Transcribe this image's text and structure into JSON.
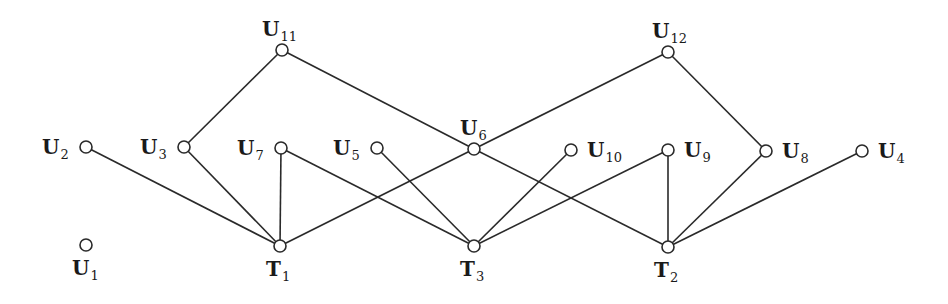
{
  "diagram": {
    "type": "bipartite-graph",
    "node_radius": 6,
    "nodes": [
      {
        "id": "U11",
        "letter": "U",
        "sub": "11",
        "x": 282,
        "y": 50,
        "label_dx": -20,
        "label_dy": -14
      },
      {
        "id": "U12",
        "letter": "U",
        "sub": "12",
        "x": 668,
        "y": 52,
        "label_dx": -16,
        "label_dy": -14
      },
      {
        "id": "U2",
        "letter": "U",
        "sub": "2",
        "x": 86,
        "y": 147,
        "label_dx": -44,
        "label_dy": 7
      },
      {
        "id": "U3",
        "letter": "U",
        "sub": "3",
        "x": 184,
        "y": 147,
        "label_dx": -44,
        "label_dy": 7
      },
      {
        "id": "U7",
        "letter": "U",
        "sub": "7",
        "x": 281,
        "y": 148,
        "label_dx": -44,
        "label_dy": 7
      },
      {
        "id": "U5",
        "letter": "U",
        "sub": "5",
        "x": 377,
        "y": 148,
        "label_dx": -44,
        "label_dy": 7
      },
      {
        "id": "U6",
        "letter": "U",
        "sub": "6",
        "x": 474,
        "y": 149,
        "label_dx": -14,
        "label_dy": -14
      },
      {
        "id": "U10",
        "letter": "U",
        "sub": "10",
        "x": 571,
        "y": 150,
        "label_dx": 16,
        "label_dy": 7
      },
      {
        "id": "U9",
        "letter": "U",
        "sub": "9",
        "x": 668,
        "y": 150,
        "label_dx": 16,
        "label_dy": 7
      },
      {
        "id": "U8",
        "letter": "U",
        "sub": "8",
        "x": 766,
        "y": 151,
        "label_dx": 16,
        "label_dy": 7
      },
      {
        "id": "U4",
        "letter": "U",
        "sub": "4",
        "x": 862,
        "y": 151,
        "label_dx": 16,
        "label_dy": 7
      },
      {
        "id": "U1",
        "letter": "U",
        "sub": "1",
        "x": 86,
        "y": 245,
        "label_dx": -14,
        "label_dy": 30
      },
      {
        "id": "T1",
        "letter": "T",
        "sub": "1",
        "x": 280,
        "y": 246,
        "label_dx": -14,
        "label_dy": 30
      },
      {
        "id": "T3",
        "letter": "T",
        "sub": "3",
        "x": 474,
        "y": 246,
        "label_dx": -14,
        "label_dy": 30
      },
      {
        "id": "T2",
        "letter": "T",
        "sub": "2",
        "x": 668,
        "y": 247,
        "label_dx": -14,
        "label_dy": 30
      }
    ],
    "edges": [
      [
        "U2",
        "T1"
      ],
      [
        "U3",
        "T1"
      ],
      [
        "U3",
        "U11"
      ],
      [
        "U11",
        "U6"
      ],
      [
        "U7",
        "T1"
      ],
      [
        "U7",
        "T3"
      ],
      [
        "U5",
        "T3"
      ],
      [
        "T1",
        "U6"
      ],
      [
        "U6",
        "U12"
      ],
      [
        "U6",
        "T2"
      ],
      [
        "U10",
        "T3"
      ],
      [
        "U9",
        "T3"
      ],
      [
        "U9",
        "T2"
      ],
      [
        "U12",
        "U8"
      ],
      [
        "U8",
        "T2"
      ],
      [
        "U4",
        "T2"
      ]
    ]
  }
}
